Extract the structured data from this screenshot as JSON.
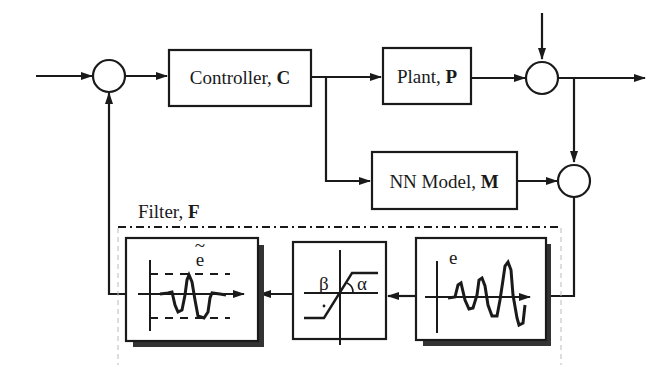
{
  "diagram": {
    "type": "block-diagram",
    "blocks": {
      "controller": {
        "name": "Controller, ",
        "symbol": "C"
      },
      "plant": {
        "name": "Plant, ",
        "symbol": "P"
      },
      "nn_model": {
        "name": "NN Model, ",
        "symbol": "M"
      }
    },
    "filter": {
      "label": "Filter, ",
      "symbol": "F",
      "stages": {
        "input_signal": {
          "label": "e"
        },
        "saturation": {
          "beta": "β",
          "alpha": "α"
        },
        "output_signal": {
          "label": "e",
          "accent": "~"
        }
      }
    },
    "colors": {
      "stroke": "#1a1a1a",
      "shadow": "#333333",
      "background": "#ffffff",
      "guide": "#bbbbbb"
    }
  }
}
